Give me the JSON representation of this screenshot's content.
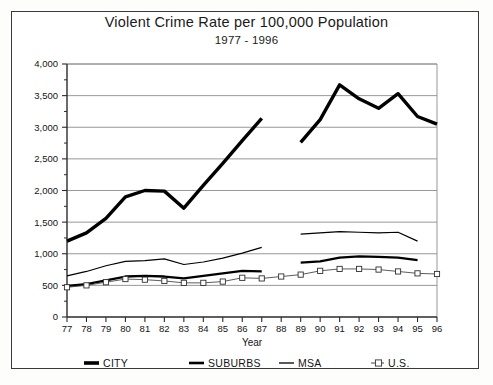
{
  "chart_data": {
    "type": "line",
    "title": "Violent Crime Rate per 100,000 Population",
    "subtitle": "1977 - 1996",
    "xlabel": "Year",
    "ylabel": "",
    "grid": true,
    "legend_position": "bottom",
    "xlim": [
      77,
      96
    ],
    "ylim": [
      0,
      4000
    ],
    "ytick_step": 500,
    "yminor_step": 250,
    "x": [
      77,
      78,
      79,
      80,
      81,
      82,
      83,
      84,
      85,
      86,
      87,
      88,
      89,
      90,
      91,
      92,
      93,
      94,
      95,
      96
    ],
    "categories": [
      "77",
      "78",
      "79",
      "80",
      "81",
      "82",
      "83",
      "84",
      "85",
      "86",
      "87",
      "88",
      "89",
      "90",
      "91",
      "92",
      "93",
      "94",
      "95",
      "96"
    ],
    "ytick_labels": [
      "0",
      "500",
      "1,000",
      "1,500",
      "2,000",
      "2,500",
      "3,000",
      "3,500",
      "4,000"
    ],
    "ytick_values": [
      0,
      500,
      1000,
      1500,
      2000,
      2500,
      3000,
      3500,
      4000
    ],
    "series": [
      {
        "name": "CITY",
        "style": "thick-line",
        "marker": "none",
        "color": "#000000",
        "x": [
          77,
          78,
          79,
          80,
          81,
          82,
          83,
          84,
          85,
          86,
          87,
          89,
          90,
          91,
          92,
          93,
          94,
          95,
          96
        ],
        "values": [
          1200,
          1330,
          1560,
          1900,
          2000,
          1990,
          1720,
          2080,
          2430,
          2790,
          3140,
          2760,
          3120,
          3670,
          3450,
          3300,
          3530,
          3170,
          3050
        ],
        "gaps": [
          [
            87,
            89
          ]
        ]
      },
      {
        "name": "SUBURBS",
        "style": "medium-line",
        "marker": "none",
        "color": "#000000",
        "x": [
          77,
          78,
          79,
          80,
          81,
          82,
          83,
          84,
          85,
          86,
          87,
          89,
          90,
          91,
          92,
          93,
          94,
          95
        ],
        "values": [
          490,
          520,
          580,
          640,
          650,
          640,
          610,
          650,
          690,
          730,
          720,
          860,
          880,
          940,
          960,
          950,
          940,
          900
        ],
        "gaps": [
          [
            87,
            89
          ]
        ]
      },
      {
        "name": "MSA",
        "style": "thin-line",
        "marker": "none",
        "color": "#000000",
        "x": [
          77,
          78,
          79,
          80,
          81,
          82,
          83,
          84,
          85,
          86,
          87,
          89,
          90,
          91,
          92,
          93,
          94,
          95
        ],
        "values": [
          650,
          720,
          810,
          880,
          890,
          920,
          830,
          870,
          930,
          1010,
          1100,
          1310,
          1330,
          1350,
          1340,
          1330,
          1340,
          1200
        ],
        "gaps": [
          [
            87,
            89
          ]
        ]
      },
      {
        "name": "U.S.",
        "style": "thin-line-marker",
        "marker": "open-square",
        "color": "#4a4a4a",
        "x": [
          77,
          78,
          79,
          80,
          81,
          82,
          83,
          84,
          85,
          86,
          87,
          88,
          89,
          90,
          91,
          92,
          93,
          94,
          95,
          96
        ],
        "values": [
          470,
          500,
          550,
          600,
          590,
          570,
          540,
          540,
          560,
          620,
          610,
          640,
          670,
          730,
          760,
          760,
          750,
          720,
          690,
          680
        ]
      }
    ],
    "legend": [
      {
        "label": "CITY",
        "style": "thick-line"
      },
      {
        "label": "SUBURBS",
        "style": "medium-line"
      },
      {
        "label": "MSA",
        "style": "thin-line"
      },
      {
        "label": "U.S.",
        "style": "thin-line-marker"
      }
    ],
    "colors": {
      "line": "#000000",
      "grid": "#8c8c8c",
      "axis": "#2b2b2b",
      "background": "#ffffff"
    }
  }
}
